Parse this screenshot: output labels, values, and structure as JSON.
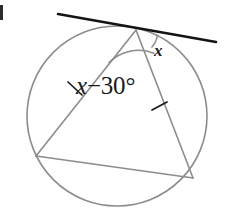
{
  "figure": {
    "width": 227,
    "height": 212,
    "background_color": "#ffffff"
  },
  "circle": {
    "name": "circle",
    "center_x": 117,
    "center_y": 116,
    "radius": 90,
    "stroke_color": "#8c8c8c",
    "stroke_width": 1.6,
    "fill": "none"
  },
  "tangent_line": {
    "name": "tangent-line",
    "x1": 58,
    "y1": 14,
    "x2": 216,
    "y2": 42,
    "stroke_color": "#141414",
    "stroke_width": 2.6,
    "touch_point_x": 136,
    "touch_point_y": 30
  },
  "triangle": {
    "name": "inscribed-triangle",
    "stroke_color": "#8c8c8c",
    "stroke_width": 1.6,
    "vertices": [
      {
        "name": "apex-vertex",
        "x": 136,
        "y": 30
      },
      {
        "name": "left-vertex",
        "x": 36,
        "y": 156
      },
      {
        "name": "right-vertex",
        "x": 193,
        "y": 178
      }
    ],
    "sides": [
      {
        "name": "left-side",
        "x1": 136,
        "y1": 30,
        "x2": 36,
        "y2": 156
      },
      {
        "name": "right-side",
        "x1": 136,
        "y1": 30,
        "x2": 193,
        "y2": 178
      },
      {
        "name": "bottom-chord",
        "x1": 36,
        "y1": 156,
        "x2": 193,
        "y2": 178
      }
    ]
  },
  "angle_arcs": [
    {
      "name": "apex-inner-angle-arc",
      "path": "M 108.5 63 A 42 42 0 0 1 154.5 53.5",
      "stroke_color": "#8c8c8c",
      "stroke_width": 1.5
    },
    {
      "name": "tangent-angle-arc",
      "path": "M 151.5 47.5 A 22 22 0 0 0 157.5 34.5",
      "stroke_color": "#8c8c8c",
      "stroke_width": 1.5
    }
  ],
  "tick_marks": [
    {
      "name": "left-side-congruence-tick",
      "x1": 68,
      "y1": 82,
      "x2": 82,
      "y2": 95,
      "stroke_color": "#1a1a1a",
      "stroke_width": 1.7
    },
    {
      "name": "right-side-congruence-tick",
      "x1": 152,
      "y1": 110,
      "x2": 167,
      "y2": 102,
      "stroke_color": "#1a1a1a",
      "stroke_width": 1.7
    }
  ],
  "labels": {
    "angle_expression": {
      "name": "angle-expression-label",
      "variable": "x",
      "operator": "−",
      "value": "30",
      "unit": "°",
      "full_text": "x − 30°"
    },
    "tangent_angle": {
      "name": "tangent-angle-label",
      "text": "x"
    }
  },
  "colors": {
    "line_gray": "#8c8c8c",
    "line_black": "#141414",
    "text": "#1a1a1a",
    "background": "#ffffff"
  }
}
